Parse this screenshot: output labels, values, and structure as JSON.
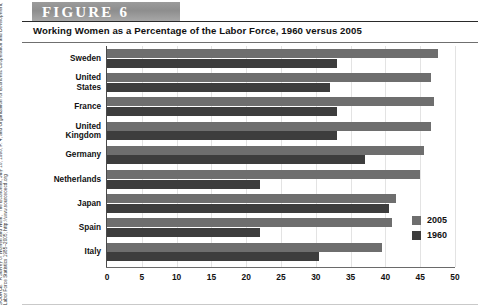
{
  "figure": {
    "banner_label": "FIGURE 6",
    "subtitle": "Working Women as a Percentage of the Labor Force, 1960 versus 2005",
    "source_note": "SOURCE: \"A Survey of Women and Work,\" The Economist, July 18, 1998, P. 4, and Organization for Economic Cooperation and Development, Labor Force Statistics 1985–2005; http://www.sourceoecd.org"
  },
  "legend": {
    "position": "right-bottom",
    "entries": [
      {
        "label": "2005",
        "color": "#6e6e6e"
      },
      {
        "label": "1960",
        "color": "#3d3d3d"
      }
    ]
  },
  "chart_data": {
    "type": "bar",
    "orientation": "horizontal",
    "title": "Working Women as a Percentage of the Labor Force, 1960 versus 2005",
    "xlabel": "",
    "ylabel": "",
    "xlim": [
      0,
      50
    ],
    "xticks": [
      0,
      5,
      10,
      15,
      20,
      25,
      30,
      35,
      40,
      45,
      50
    ],
    "xtick_labels": [
      "0",
      "5",
      "10",
      "15",
      "20",
      "25",
      "30",
      "35",
      "40",
      "45",
      "50"
    ],
    "grid": true,
    "grid_axis": "x",
    "categories": [
      "Sweden",
      "United States",
      "France",
      "United Kingdom",
      "Germany",
      "Netherlands",
      "Japan",
      "Spain",
      "Italy"
    ],
    "category_lines": [
      [
        "Sweden"
      ],
      [
        "United",
        "States"
      ],
      [
        "France"
      ],
      [
        "United",
        "Kingdom"
      ],
      [
        "Germany"
      ],
      [
        "Netherlands"
      ],
      [
        "Japan"
      ],
      [
        "Spain"
      ],
      [
        "Italy"
      ]
    ],
    "series": [
      {
        "name": "2005",
        "color": "#6e6e6e",
        "values": [
          47.5,
          46.5,
          47.0,
          46.5,
          45.5,
          45.0,
          41.5,
          41.0,
          39.5
        ]
      },
      {
        "name": "1960",
        "color": "#3d3d3d",
        "values": [
          33.0,
          32.0,
          33.0,
          33.0,
          37.0,
          22.0,
          40.5,
          22.0,
          30.5
        ]
      }
    ]
  }
}
